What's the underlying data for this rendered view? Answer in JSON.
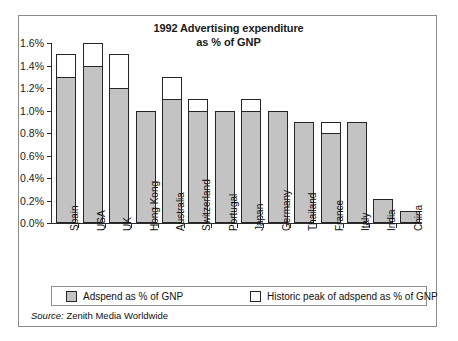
{
  "chart_data": {
    "type": "bar",
    "title": "1992 Advertising expenditure as % of GNP",
    "title_line1": "1992 Advertising expenditure",
    "title_line2": "as % of GNP",
    "xlabel": "",
    "ylabel": "",
    "ylim": [
      0.0,
      1.6
    ],
    "ytick_step": 0.2,
    "grid": false,
    "legend_position": "bottom",
    "value_unit": "%",
    "ytick_labels": [
      "0.0%",
      "0.2%",
      "0.4%",
      "0.6%",
      "0.8%",
      "1.0%",
      "1.2%",
      "1.4%",
      "1.6%"
    ],
    "ytick_values": [
      0.0,
      0.2,
      0.4,
      0.6,
      0.8,
      1.0,
      1.2,
      1.4,
      1.6
    ],
    "categories": [
      "Spain",
      "USA",
      "UK",
      "Hong Kong",
      "Australia",
      "Switzerland",
      "Portugal",
      "Japan",
      "Germany",
      "Thailand",
      "France",
      "Italy",
      "India",
      "China"
    ],
    "series": [
      {
        "name": "Adspend as % of GNP",
        "color": "#c3c3c3",
        "values": [
          1.3,
          1.4,
          1.2,
          1.0,
          1.1,
          1.0,
          1.0,
          1.0,
          1.0,
          0.9,
          0.8,
          0.9,
          0.21,
          0.11
        ]
      },
      {
        "name": "Historic peak of adspend as % of GNP",
        "color": "#ffffff",
        "values": [
          1.5,
          1.6,
          1.5,
          1.0,
          1.3,
          1.1,
          1.0,
          1.1,
          1.0,
          0.9,
          0.9,
          0.9,
          0.21,
          0.11
        ]
      }
    ],
    "source": "Source: Zenith Media Worldwide"
  },
  "legend": {
    "entries": [
      {
        "label": "Adspend as % of GNP",
        "swatch": "filled"
      },
      {
        "label": "Historic peak of adspend as % of GNP",
        "swatch": "hollow"
      }
    ]
  },
  "source": {
    "label": "Source:",
    "text": " Zenith Media Worldwide"
  }
}
